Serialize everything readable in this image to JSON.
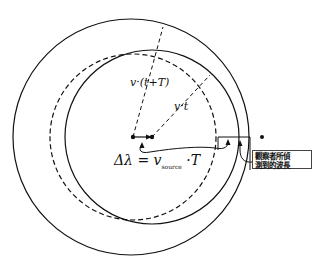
{
  "diagram": {
    "labels": {
      "radius_t_plus_T": "v·(t+T)",
      "radius_t": "v·t",
      "formula_prefix": "Δλ = v",
      "formula_sub": "source",
      "formula_suffix": " ·T",
      "observer_line1": "觀察者所偵",
      "observer_line2": "測到的波長"
    },
    "elements": {
      "outer_wavefront": {
        "cx": 131,
        "cy": 137,
        "r": 118,
        "style": "solid"
      },
      "reference_wavefront": {
        "cx": 133,
        "cy": 137,
        "r": 83,
        "style": "dashed"
      },
      "inner_wavefront": {
        "cx": 152,
        "cy": 137,
        "r": 87,
        "style": "solid"
      },
      "source_old_position": {
        "x": 133,
        "y": 137
      },
      "source_new_position": {
        "x": 152,
        "y": 137
      },
      "observer": {
        "x": 262,
        "y": 137
      }
    },
    "colors": {
      "line": "#111111",
      "background": "#ffffff"
    }
  }
}
